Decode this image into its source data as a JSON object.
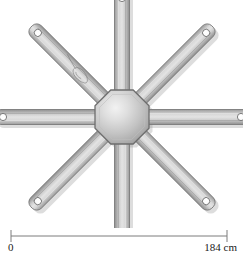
{
  "figure": {
    "background_color": "#ffffff"
  },
  "device": {
    "name": "octagonal-hub-spider",
    "hub": {
      "shape": "octagon",
      "center_x": 122,
      "center_y": 117,
      "radius": 27,
      "fill_light": "#ededed",
      "fill_mid": "#c2c2c2",
      "fill_dark": "#9a9a9a",
      "stroke": "#6e6e6e"
    },
    "arm_count": 8,
    "arm_length": 112,
    "arm_width": 15,
    "arm_fill_edge": "#9d9d9d",
    "arm_fill_center": "#d8d8d8",
    "arm_stroke": "#7a7a7a",
    "hole_fill": "#ffffff",
    "hole_stroke": "#6e6e6e",
    "hole_radius": 3.6,
    "shadow_color": "rgba(120,120,120,0.30)",
    "arms": [
      {
        "label": "arm-n",
        "angle": -90,
        "has_marking": false
      },
      {
        "label": "arm-ne",
        "angle": -45,
        "has_marking": false
      },
      {
        "label": "arm-e",
        "angle": 0,
        "has_marking": false
      },
      {
        "label": "arm-se",
        "angle": 45,
        "has_marking": false
      },
      {
        "label": "arm-s",
        "angle": 90,
        "has_marking": false
      },
      {
        "label": "arm-sw",
        "angle": 135,
        "has_marking": false
      },
      {
        "label": "arm-w",
        "angle": 180,
        "has_marking": false
      },
      {
        "label": "arm-nw",
        "angle": -135,
        "has_marking": true
      }
    ]
  },
  "scale": {
    "name": "scale-bar",
    "min_label": "0",
    "max_label": "184 cm",
    "min_value": 0,
    "max_value": 184,
    "unit": "cm",
    "line_color": "#7d7d7d",
    "tick_left_x": 11,
    "tick_right_x": 227
  }
}
